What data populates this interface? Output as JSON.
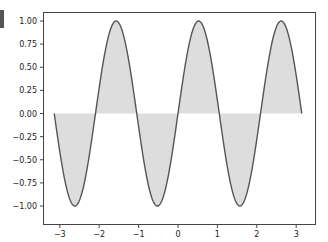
{
  "chart_data": {
    "type": "area",
    "title": "",
    "xlabel": "",
    "ylabel": "",
    "function": "y = sin(3x)",
    "series": [
      {
        "name": "sin(3x)",
        "x_range": [
          -3.14159,
          3.14159
        ],
        "fill_to": 0,
        "line_color": "#555555",
        "fill_color": "#dddddd",
        "x": [
          -3.1416,
          -2.618,
          -2.0944,
          -1.5708,
          -1.0472,
          -0.5236,
          0.0,
          0.5236,
          1.0472,
          1.5708,
          2.0944,
          2.618,
          3.1416
        ],
        "values": [
          0.0,
          -1.0,
          0.0,
          1.0,
          0.0,
          -1.0,
          0.0,
          1.0,
          0.0,
          -1.0,
          0.0,
          1.0,
          0.0
        ]
      }
    ],
    "xlim": [
      -3.46,
      3.46
    ],
    "ylim": [
      -1.1,
      1.1
    ],
    "xticks": [
      -3,
      -2,
      -1,
      0,
      1,
      2,
      3
    ],
    "xtick_labels": [
      "−3",
      "−2",
      "−1",
      "0",
      "1",
      "2",
      "3"
    ],
    "yticks": [
      1.0,
      0.75,
      0.5,
      0.25,
      0.0,
      -0.25,
      -0.5,
      -0.75,
      -1.0
    ],
    "ytick_labels": [
      "1.00",
      "0.75",
      "0.50",
      "0.25",
      "0.00",
      "−0.25",
      "−0.50",
      "−0.75",
      "−1.00"
    ],
    "grid": false,
    "legend": null
  },
  "colors": {
    "line": "#555555",
    "fill": "#dddddd",
    "axes": "#444444",
    "corner_block": "#555555"
  }
}
